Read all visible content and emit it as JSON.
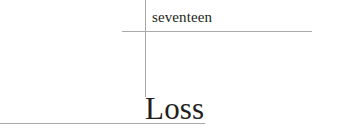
{
  "page": {
    "background_color": "#ffffff",
    "text_color": "#231f20",
    "rule_color": "#aaaaac"
  },
  "chapter": {
    "number_label": "seventeen",
    "title": "Loss"
  },
  "rules": {
    "top_rule_name": "top-horizontal-rule",
    "vertical_rule_name": "vertical-rule",
    "bottom_rule_name": "bottom-horizontal-rule"
  }
}
